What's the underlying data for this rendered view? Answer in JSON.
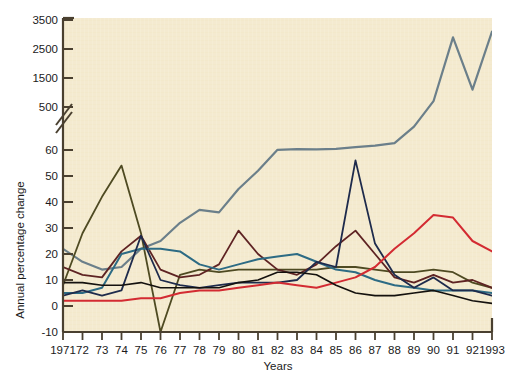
{
  "chart_data": {
    "type": "line",
    "title": "",
    "xlabel": "Years",
    "ylabel": "Annual percentage change",
    "grid": false,
    "legend": "none",
    "broken_axis": true,
    "x": [
      1971,
      1972,
      1973,
      1974,
      1975,
      1976,
      1977,
      1978,
      1979,
      1980,
      1981,
      1982,
      1983,
      1984,
      1985,
      1986,
      1987,
      1988,
      1989,
      1990,
      1991,
      1992,
      1993
    ],
    "xtick_labels": [
      "1971",
      "72",
      "73",
      "74",
      "75",
      "76",
      "77",
      "78",
      "79",
      "80",
      "81",
      "82",
      "83",
      "84",
      "85",
      "86",
      "87",
      "88",
      "89",
      "90",
      "91",
      "92",
      "1993"
    ],
    "ytick_labels_lower": [
      "-10",
      "0",
      "10",
      "20",
      "30",
      "40",
      "50",
      "60"
    ],
    "ytick_values_lower": [
      -10,
      0,
      10,
      20,
      30,
      40,
      50,
      60
    ],
    "ytick_labels_upper": [
      "500",
      "1500",
      "2500",
      "3500"
    ],
    "ytick_values_upper": [
      500,
      1500,
      2500,
      3500
    ],
    "ylim_lower": [
      -10,
      60
    ],
    "ylim_upper": [
      500,
      3500
    ],
    "xlim": [
      1971,
      1993
    ],
    "series": [
      {
        "name": "series-grey-blue",
        "color": "#6b7f8a",
        "width": 2.2,
        "values": [
          22,
          17,
          14,
          15,
          22,
          25,
          32,
          37,
          36,
          45,
          52,
          62,
          68,
          66,
          72,
          90,
          105,
          130,
          300,
          700,
          2900,
          1100,
          3100
        ]
      },
      {
        "name": "series-dark-olive",
        "color": "#4e4a22",
        "width": 1.8,
        "values": [
          8,
          28,
          42,
          54,
          28,
          -10,
          12,
          14,
          13,
          14,
          14,
          14,
          14,
          14,
          15,
          15,
          14,
          13,
          13,
          14,
          13,
          9,
          7
        ]
      },
      {
        "name": "series-dark-maroon",
        "color": "#5e2323",
        "width": 1.8,
        "values": [
          15,
          12,
          11,
          21,
          27,
          14,
          11,
          12,
          16,
          29,
          20,
          14,
          12,
          16,
          23,
          29,
          20,
          11,
          9,
          12,
          9,
          10,
          7
        ]
      },
      {
        "name": "series-teal",
        "color": "#2d6b84",
        "width": 2.0,
        "values": [
          5,
          5,
          7,
          20,
          22,
          22,
          21,
          16,
          14,
          16,
          18,
          19,
          20,
          17,
          14,
          13,
          10,
          8,
          7,
          6,
          6,
          6,
          5
        ]
      },
      {
        "name": "series-navy",
        "color": "#1e2b4c",
        "width": 1.8,
        "values": [
          4,
          6,
          4,
          6,
          27,
          10,
          8,
          7,
          8,
          9,
          9,
          9,
          10,
          17,
          15,
          56,
          24,
          12,
          7,
          11,
          6,
          6,
          4
        ]
      },
      {
        "name": "series-red",
        "color": "#d32b32",
        "width": 2.0,
        "values": [
          2,
          2,
          2,
          2,
          3,
          3,
          5,
          6,
          6,
          7,
          8,
          9,
          8,
          7,
          9,
          11,
          15,
          22,
          28,
          35,
          34,
          25,
          21
        ]
      },
      {
        "name": "series-black",
        "color": "#14110e",
        "width": 1.6,
        "values": [
          9,
          9,
          8,
          8,
          9,
          7,
          7,
          7,
          7,
          9,
          10,
          13,
          13,
          12,
          8,
          5,
          4,
          4,
          5,
          6,
          4,
          2,
          1
        ]
      }
    ],
    "annotations": []
  },
  "figure": {
    "background": "#ffffff",
    "plot_background": "#f4ead0",
    "axis_color": "#4a4030",
    "axis_break_symbol": "//"
  }
}
